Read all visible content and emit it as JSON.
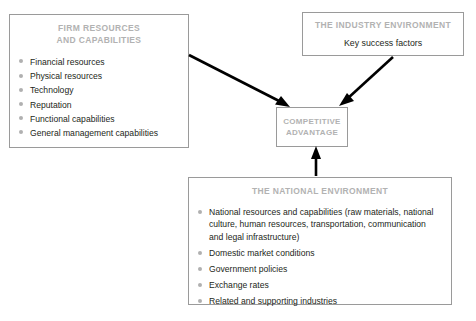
{
  "diagram": {
    "firm_resources": {
      "title": "FIRM RESOURCES\nAND CAPABILITIES",
      "title_line1": "FIRM RESOURCES",
      "title_line2": "AND CAPABILITIES",
      "items": [
        "Financial resources",
        "Physical resources",
        "Technology",
        "Reputation",
        "Functional capabilities",
        "General management capabilities"
      ]
    },
    "industry_environment": {
      "title": "THE INDUSTRY ENVIRONMENT",
      "text": "Key success factors"
    },
    "competitive_advantage": {
      "title_line1": "COMPETITIVE",
      "title_line2": "ADVANTAGE"
    },
    "national_environment": {
      "title": "THE NATIONAL ENVIRONMENT",
      "items": [
        "National resources and capabilities (raw materials, national culture, human resources, transportation, communication and legal infrastructure)",
        "Domestic market conditions",
        "Government policies",
        "Exchange rates",
        "Related and supporting industries"
      ]
    },
    "colors": {
      "box_border": "#9a9a9a",
      "title_gray": "#b2b2b2",
      "bullet_gray": "#b0b0b0",
      "body_text": "#231f20",
      "arrow": "#000000",
      "background": "#ffffff"
    },
    "arrows": [
      {
        "name": "firm-to-advantage",
        "from": "firm_resources",
        "to": "competitive_advantage"
      },
      {
        "name": "industry-to-advantage",
        "from": "industry_environment",
        "to": "competitive_advantage"
      },
      {
        "name": "national-to-advantage",
        "from": "national_environment",
        "to": "competitive_advantage"
      }
    ]
  }
}
